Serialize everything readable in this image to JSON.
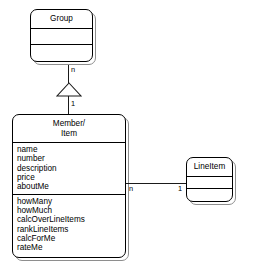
{
  "diagram": {
    "type": "uml-class-diagram",
    "title": "",
    "background_color": "#ffffff",
    "line_color": "#1a1a1a",
    "text_color": "#000000"
  },
  "classes": [
    {
      "id": "group",
      "name": "Group",
      "name_lines": "Group",
      "attributes": [],
      "operations": [],
      "compartments": 3,
      "x": 30,
      "y": 9,
      "width": 66,
      "height": 56
    },
    {
      "id": "member_item",
      "name": "Member/Item",
      "name_lines": "Member/\nItem",
      "attributes": [
        "name",
        "number",
        "description",
        "price",
        "aboutMe"
      ],
      "operations": [
        "howMany",
        "howMuch",
        "calcOverLineItems",
        "rankLineItems",
        "calcForMe",
        "rateMe"
      ],
      "compartments": 3,
      "x": 12,
      "y": 114,
      "width": 117,
      "height": 147
    },
    {
      "id": "line_item",
      "name": "LineItem",
      "name_lines": "LineItem",
      "attributes": [],
      "operations": [],
      "compartments": 3,
      "x": 186,
      "y": 157,
      "width": 50,
      "height": 48
    }
  ],
  "relationships": [
    {
      "id": "group-member-generalization",
      "kind": "generalization",
      "from": "member_item",
      "to": "group",
      "from_multiplicity": "1",
      "to_multiplicity": "n",
      "orientation": "vertical"
    },
    {
      "id": "member-lineitem-association",
      "kind": "association",
      "from": "member_item",
      "to": "line_item",
      "from_multiplicity": "n",
      "to_multiplicity": "1",
      "orientation": "horizontal"
    }
  ],
  "multiplicity_labels": {
    "group_end": "n",
    "member_top_end": "1",
    "member_right_end": "n",
    "lineitem_end": "1"
  }
}
